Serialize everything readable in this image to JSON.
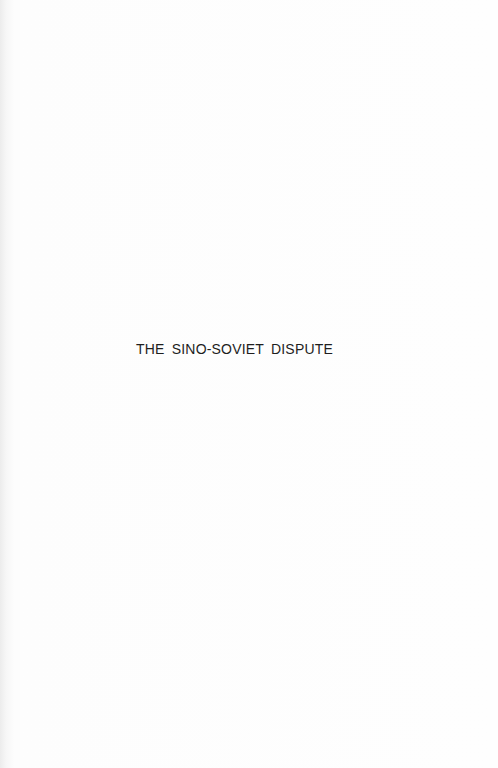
{
  "page": {
    "type": "half-title",
    "title": "THE SINO-SOVIET DISPUTE"
  }
}
